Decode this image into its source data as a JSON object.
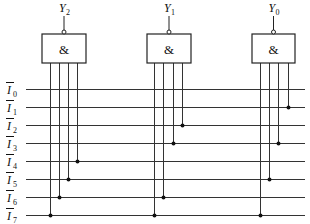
{
  "diagram": {
    "type": "logic-circuit-encoder",
    "input_lines": [
      {
        "label": "I",
        "sub": "0",
        "overbar": true,
        "y": 89
      },
      {
        "label": "I",
        "sub": "1",
        "overbar": true,
        "y": 107
      },
      {
        "label": "I",
        "sub": "2",
        "overbar": true,
        "y": 125
      },
      {
        "label": "I",
        "sub": "3",
        "overbar": true,
        "y": 143
      },
      {
        "label": "I",
        "sub": "4",
        "overbar": true,
        "y": 161
      },
      {
        "label": "I",
        "sub": "5",
        "overbar": true,
        "y": 179
      },
      {
        "label": "I",
        "sub": "6",
        "overbar": true,
        "y": 197
      },
      {
        "label": "I",
        "sub": "7",
        "overbar": true,
        "y": 215
      }
    ],
    "line_x_start": 26,
    "line_x_end": 305,
    "gates": [
      {
        "output_label": "Y",
        "output_sub": "2",
        "symbol": "&",
        "box": {
          "x": 42,
          "y": 34,
          "w": 44,
          "h": 29
        },
        "inputs": [
          {
            "x": 50,
            "connects": "I7",
            "end_y": 215
          },
          {
            "x": 59,
            "connects": "I6",
            "end_y": 197
          },
          {
            "x": 68,
            "connects": "I5",
            "end_y": 179
          },
          {
            "x": 77,
            "connects": "I4",
            "end_y": 161
          }
        ]
      },
      {
        "output_label": "Y",
        "output_sub": "1",
        "symbol": "&",
        "box": {
          "x": 147,
          "y": 34,
          "w": 44,
          "h": 29
        },
        "inputs": [
          {
            "x": 154,
            "connects": "I7",
            "end_y": 215
          },
          {
            "x": 163,
            "connects": "I6",
            "end_y": 197
          },
          {
            "x": 173,
            "connects": "I3",
            "end_y": 143
          },
          {
            "x": 182,
            "connects": "I2",
            "end_y": 125
          }
        ]
      },
      {
        "output_label": "Y",
        "output_sub": "0",
        "symbol": "&",
        "box": {
          "x": 252,
          "y": 34,
          "w": 43,
          "h": 29
        },
        "inputs": [
          {
            "x": 260,
            "connects": "I7",
            "end_y": 215
          },
          {
            "x": 269,
            "connects": "I5",
            "end_y": 179
          },
          {
            "x": 278,
            "connects": "I3",
            "end_y": 143
          },
          {
            "x": 288,
            "connects": "I1",
            "end_y": 107
          }
        ]
      }
    ]
  }
}
